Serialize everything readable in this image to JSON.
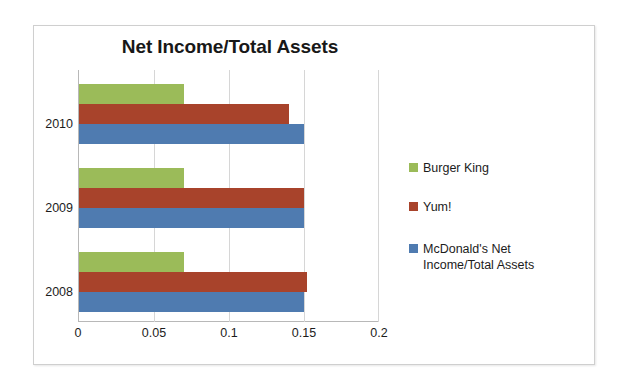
{
  "chart_data": {
    "type": "bar",
    "orientation": "horizontal",
    "title": "Net Income/Total Assets",
    "xlabel": "",
    "ylabel": "",
    "categories": [
      "2010",
      "2009",
      "2008"
    ],
    "category_order_top_to_bottom": [
      "2010",
      "2009",
      "2008"
    ],
    "series": [
      {
        "name": "Burger King",
        "color": "#9BBB59",
        "values": [
          0.07,
          0.07,
          0.07
        ]
      },
      {
        "name": "Yum!",
        "color": "#A8432B",
        "values": [
          0.14,
          0.15,
          0.152
        ]
      },
      {
        "name": "McDonald's Net Income/Total Assets",
        "color": "#4F7BB0",
        "values": [
          0.15,
          0.15,
          0.15
        ]
      }
    ],
    "xlim": [
      0,
      0.2
    ],
    "xticks": [
      "0",
      "0.05",
      "0.1",
      "0.15",
      "0.2"
    ],
    "xtick_values": [
      0,
      0.05,
      0.1,
      0.15,
      0.2
    ],
    "grid": "vertical",
    "legend_position": "right"
  },
  "legend": {
    "items": [
      {
        "label": "Burger King",
        "color": "#9BBB59"
      },
      {
        "label": "Yum!",
        "color": "#A8432B"
      },
      {
        "label": "McDonald's Net Income/Total Assets",
        "color": "#4F7BB0"
      }
    ]
  }
}
